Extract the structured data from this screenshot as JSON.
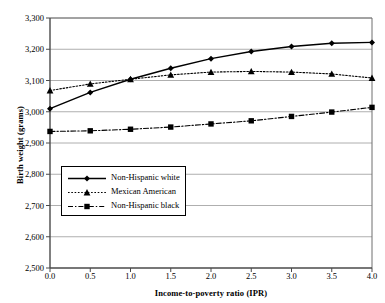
{
  "chart_data": {
    "type": "line",
    "title": "",
    "subtitle": "",
    "xlabel": "Income-to-poverty ratio (IPR)",
    "ylabel": "Birth weight (grams)",
    "x": [
      0.0,
      0.5,
      1.0,
      1.5,
      2.0,
      2.5,
      3.0,
      3.5,
      4.0
    ],
    "xtick_labels": [
      "0.0",
      "0.5",
      "1.0",
      "1.5",
      "2.0",
      "2.5",
      "3.0",
      "3.5",
      "4.0"
    ],
    "ytick_labels": [
      "3,300",
      "3,200",
      "3,100",
      "3,000",
      "2,900",
      "2,800",
      "2,700",
      "2,600",
      "2,500"
    ],
    "ytick_values": [
      3300,
      3200,
      3100,
      3000,
      2900,
      2800,
      2700,
      2600,
      2500
    ],
    "xlim": [
      0.0,
      4.0
    ],
    "ylim": [
      2500,
      3300
    ],
    "grid": "horizontal",
    "legend_position": "lower left inside",
    "series": [
      {
        "name": "Non-Hispanic white",
        "marker": "diamond",
        "linestyle": "solid",
        "color": "#000000",
        "values": [
          3010,
          3062,
          3104,
          3139,
          3170,
          3193,
          3209,
          3219,
          3222
        ]
      },
      {
        "name": "Mexican American",
        "marker": "triangle",
        "linestyle": "dotted",
        "color": "#000000",
        "values": [
          3068,
          3089,
          3104,
          3118,
          3127,
          3129,
          3127,
          3121,
          3108
        ]
      },
      {
        "name": "Non-Hispanic black",
        "marker": "square",
        "linestyle": "dashdot",
        "color": "#000000",
        "values": [
          2937,
          2939,
          2944,
          2951,
          2961,
          2971,
          2985,
          2999,
          3014
        ]
      }
    ]
  }
}
